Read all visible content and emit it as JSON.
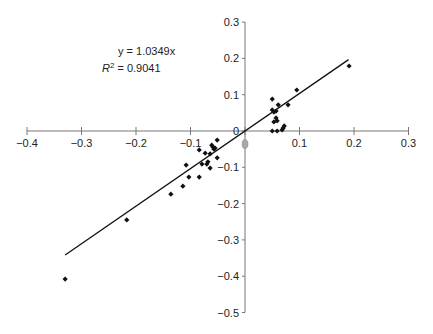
{
  "chart_data": {
    "type": "scatter",
    "title": "",
    "xlabel": "",
    "ylabel": "",
    "xlim": [
      -0.4,
      0.3
    ],
    "ylim": [
      -0.5,
      0.3
    ],
    "grid": false,
    "legend": "none",
    "x_ticks": [
      "-0.4",
      "-0.3",
      "-0.2",
      "-0.1",
      "0",
      "0.1",
      "0.2",
      "0.3"
    ],
    "y_ticks": [
      "0.3",
      "0.2",
      "0.1",
      "0",
      "-0.1",
      "-0.2",
      "-0.3",
      "-0.4",
      "-0.5"
    ],
    "x_tick_values": [
      -0.4,
      -0.3,
      -0.2,
      -0.1,
      0,
      0.1,
      0.2,
      0.3
    ],
    "y_tick_values": [
      0.3,
      0.2,
      0.1,
      0,
      -0.1,
      -0.2,
      -0.3,
      -0.4,
      -0.5
    ],
    "origin_label": "0",
    "annotations": {
      "equation": "y = 1.0349x",
      "r_squared_prefix": "R",
      "r_squared_sup": "2",
      "r_squared_value": " = 0.9041"
    },
    "trendline": {
      "slope": 1.0349,
      "intercept": 0,
      "x_start": -0.33,
      "x_end": 0.19,
      "r_squared": 0.9041
    },
    "series": [
      {
        "name": "data",
        "marker": "diamond",
        "color": "#111111",
        "points": [
          [
            -0.33,
            -0.408
          ],
          [
            -0.217,
            -0.245
          ],
          [
            -0.136,
            -0.174
          ],
          [
            -0.114,
            -0.152
          ],
          [
            -0.108,
            -0.094
          ],
          [
            -0.103,
            -0.127
          ],
          [
            -0.084,
            -0.127
          ],
          [
            -0.084,
            -0.052
          ],
          [
            -0.079,
            -0.091
          ],
          [
            -0.073,
            -0.061
          ],
          [
            -0.07,
            -0.091
          ],
          [
            -0.068,
            -0.085
          ],
          [
            -0.064,
            -0.102
          ],
          [
            -0.064,
            -0.063
          ],
          [
            -0.061,
            -0.039
          ],
          [
            -0.059,
            -0.044
          ],
          [
            -0.057,
            -0.05
          ],
          [
            -0.055,
            -0.047
          ],
          [
            -0.051,
            -0.074
          ],
          [
            -0.051,
            -0.025
          ],
          [
            0.05,
            0.088
          ],
          [
            0.05,
            0.058
          ],
          [
            0.053,
            0.052
          ],
          [
            0.057,
            0.055
          ],
          [
            0.061,
            0.072
          ],
          [
            0.053,
            0.025
          ],
          [
            0.057,
            0.036
          ],
          [
            0.059,
            0.028
          ],
          [
            0.05,
            0.0
          ],
          [
            0.059,
            0.0
          ],
          [
            0.068,
            0.003
          ],
          [
            0.07,
            0.008
          ],
          [
            0.072,
            0.014
          ],
          [
            0.079,
            0.072
          ],
          [
            0.095,
            0.113
          ],
          [
            0.191,
            0.179
          ]
        ]
      }
    ]
  }
}
